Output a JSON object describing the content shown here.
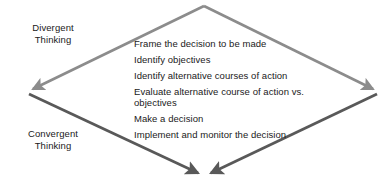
{
  "diagram": {
    "title_absent": true,
    "labels": {
      "divergent": "Divergent\nThinking",
      "divergent_line1": "Divergent",
      "divergent_line2": "Thinking",
      "convergent_line1": "Convergent",
      "convergent_line2": "Thinking"
    },
    "steps": [
      "Frame the decision to be made",
      "Identify objectives",
      "Identify alternative courses of action",
      "Evaluate alternative course of action vs. objectives",
      "Make a decision",
      "Implement and monitor the decision"
    ],
    "colors": {
      "divergent_arrow": "#8c8c8c",
      "convergent_arrow": "#595959",
      "text": "#1a1a1a",
      "background": "#ffffff"
    },
    "geometry": {
      "top_vertex": [
        204,
        5
      ],
      "left_vertex": [
        28,
        91
      ],
      "right_vertex": [
        378,
        91
      ],
      "bottom_vertex_left": [
        196,
        178
      ],
      "bottom_vertex_right": [
        213,
        178
      ]
    }
  }
}
